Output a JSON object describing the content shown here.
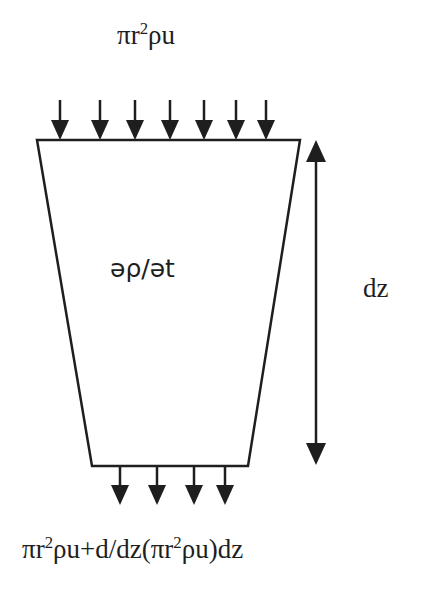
{
  "diagram": {
    "labels": {
      "inflow": {
        "base": "πr",
        "exp": "2",
        "rest": "ρu"
      },
      "outflow": {
        "p1": "πr",
        "e1": "2",
        "p2": "ρu+d/dz(πr",
        "e2": "2",
        "p3": "ρu)dz"
      },
      "accumulation": "əρ/ət",
      "height": "dz"
    },
    "shape": {
      "type": "trapezoid",
      "top_left": [
        37,
        140
      ],
      "top_right": [
        300,
        140
      ],
      "bottom_right": [
        248,
        466
      ],
      "bottom_left": [
        92,
        466
      ]
    },
    "inflow_arrows_x": [
      60,
      100,
      135,
      170,
      204,
      236,
      266
    ],
    "outflow_arrows_x": [
      120,
      157,
      194,
      225
    ],
    "dimension_arrow": {
      "x": 316,
      "y1": 140,
      "y2": 465
    },
    "colors": {
      "stroke": "#1e1e1e",
      "background": "#ffffff"
    }
  }
}
